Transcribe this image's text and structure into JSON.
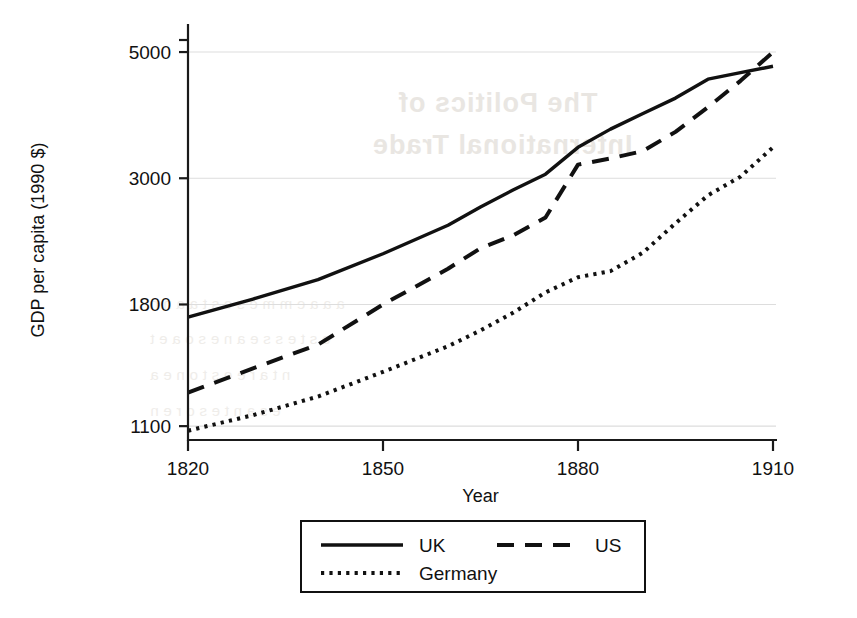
{
  "chart_data": {
    "type": "line",
    "title": "",
    "xlabel": "Year",
    "ylabel": "GDP per capita (1990 $)",
    "yscale": "log",
    "xlim": [
      1820,
      1910
    ],
    "ylim": [
      1040,
      5250
    ],
    "xticks": [
      1820,
      1850,
      1880,
      1910
    ],
    "yticks": [
      1100,
      1800,
      3000,
      5000
    ],
    "xtick_labels": [
      "1820",
      "1850",
      "1880",
      "1910"
    ],
    "ytick_labels": [
      "1100",
      "1800",
      "3000",
      "5000"
    ],
    "grid": "horizontal",
    "legend_position": "bottom-center",
    "x": [
      1820,
      1830,
      1840,
      1850,
      1860,
      1865,
      1870,
      1875,
      1880,
      1885,
      1890,
      1895,
      1900,
      1905,
      1910
    ],
    "series": [
      {
        "name": "UK",
        "style": "solid",
        "values": [
          1710,
          1840,
          1990,
          2210,
          2480,
          2670,
          2860,
          3050,
          3400,
          3660,
          3900,
          4150,
          4480,
          4600,
          4720
        ]
      },
      {
        "name": "US",
        "style": "dashed",
        "values": [
          1260,
          1390,
          1530,
          1800,
          2080,
          2260,
          2380,
          2560,
          3170,
          3250,
          3350,
          3620,
          4000,
          4450,
          5000
        ]
      },
      {
        "name": "Germany",
        "style": "dotted",
        "values": [
          1080,
          1150,
          1240,
          1370,
          1520,
          1620,
          1740,
          1890,
          2010,
          2060,
          2220,
          2500,
          2800,
          3020,
          3400
        ]
      }
    ]
  },
  "legend": {
    "items": [
      {
        "label": "UK",
        "style": "solid"
      },
      {
        "label": "US",
        "style": "dashed"
      },
      {
        "label": "Germany",
        "style": "dotted"
      }
    ]
  },
  "background_bleed": {
    "title_line1": "The Politics of",
    "title_line2": "International Trade",
    "body_line1": "a a  a  e  m  m  e s e  s   t a  a  n  n",
    "body_line2": "e  s  t e s s  e  a     n  e  s  o  a  e  t",
    "body_line3": "n  t  a  r  e  e     s   t   o  n   e   a",
    "body_line4": "e   s   a  n  t   e    s   o  r   e   n"
  }
}
